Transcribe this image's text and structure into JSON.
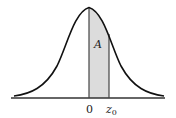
{
  "diagram": {
    "type": "normal-distribution-area",
    "area_label": "A",
    "x_labels": {
      "origin": "0",
      "bound": "z",
      "bound_subscript": "0"
    },
    "colors": {
      "curve": "#111111",
      "shade": "#dcdcdc",
      "axis": "#333333",
      "divider": "#444444"
    }
  }
}
